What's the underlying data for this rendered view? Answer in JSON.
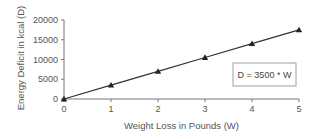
{
  "chart_data": {
    "type": "line",
    "title": "",
    "xlabel": "Weight Loss in Pounds (W)",
    "ylabel": "Energy Deficit in kcal (D)",
    "x": [
      0,
      1,
      2,
      3,
      4,
      5
    ],
    "series": [
      {
        "name": "D = 3500 * W",
        "values": [
          0,
          3500,
          7000,
          10500,
          14000,
          17500
        ],
        "marker": "triangle",
        "color": "#222222"
      }
    ],
    "xlim": [
      0,
      5
    ],
    "ylim": [
      0,
      20000
    ],
    "xticks": [
      0,
      1,
      2,
      3,
      4,
      5
    ],
    "yticks": [
      0,
      5000,
      10000,
      15000,
      20000
    ],
    "grid": false,
    "annotations": [
      {
        "text": "D = 3500 * W",
        "boxed": true
      }
    ]
  },
  "labels": {
    "xlabel": "Weight Loss in Pounds (W)",
    "ylabel": "Energy Deficit in kcal (D)",
    "equation": "D = 3500 * W",
    "xticks": [
      "0",
      "1",
      "2",
      "3",
      "4",
      "5"
    ],
    "yticks": [
      "0",
      "5000",
      "10000",
      "15000",
      "20000"
    ]
  }
}
